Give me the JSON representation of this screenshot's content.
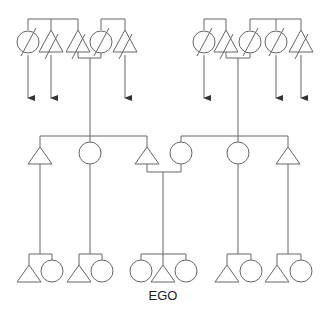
{
  "diagram": {
    "type": "kinship-chart",
    "ego_label": "EGO",
    "colors": {
      "line": "#666666",
      "background": "#ffffff",
      "text": "#222222"
    },
    "legend_symbols": {
      "triangle": "male",
      "circle": "female",
      "slash": "deceased",
      "arrow": "descendants-elsewhere"
    },
    "generations": [
      {
        "name": "grandparents-generation",
        "left_side": [
          "female-deceased",
          "male-deceased",
          "male-deceased",
          "female-deceased",
          "male-deceased"
        ],
        "right_side": [
          "female-deceased",
          "male-deceased",
          "female-deceased",
          "female-deceased",
          "male-deceased"
        ]
      },
      {
        "name": "parents-generation",
        "members": [
          "male",
          "female",
          "male (father)",
          "female (mother)",
          "female",
          "male"
        ]
      },
      {
        "name": "ego-generation",
        "groups": [
          [
            "male",
            "female"
          ],
          [
            "male",
            "female"
          ],
          [
            "female",
            "male (EGO)",
            "female"
          ],
          [
            "male",
            "female"
          ],
          [
            "male",
            "female"
          ]
        ]
      }
    ]
  }
}
